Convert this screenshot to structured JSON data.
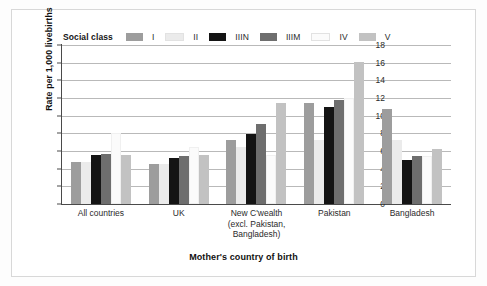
{
  "chart_data": {
    "type": "bar",
    "title": "",
    "xlabel": "Mother's country of birth",
    "ylabel": "Rate per 1,000 livebirths",
    "ylim": [
      0,
      18
    ],
    "yticks": [
      0,
      2,
      4,
      6,
      8,
      10,
      12,
      14,
      16,
      18
    ],
    "grid": true,
    "legend_title": "Social class",
    "legend_position": "top",
    "categories": [
      "All countries",
      "UK",
      "New C'wealth (excl. Pakistan, Bangladesh)",
      "Pakistan",
      "Bangladesh"
    ],
    "category_lines": [
      [
        "All countries",
        "",
        ""
      ],
      [
        "UK",
        "",
        ""
      ],
      [
        "New C'wealth",
        "(excl. Pakistan,",
        "Bangladesh)"
      ],
      [
        "Pakistan",
        "",
        ""
      ],
      [
        "Bangladesh",
        "",
        ""
      ]
    ],
    "series": [
      {
        "name": "I",
        "color": "#9d9d9d",
        "values": [
          4.7,
          4.5,
          7.3,
          11.4,
          10.8
        ]
      },
      {
        "name": "II",
        "color": "#ebebeb",
        "values": [
          4.7,
          4.5,
          6.5,
          7.2,
          7.2
        ]
      },
      {
        "name": "IIIN",
        "color": "#141414",
        "values": [
          5.5,
          5.2,
          7.9,
          11.0,
          4.95
        ]
      },
      {
        "name": "IIIM",
        "color": "#6e6e6e",
        "values": [
          5.7,
          5.45,
          9.1,
          11.8,
          5.45
        ]
      },
      {
        "name": "IV",
        "color": "#fbfbfb",
        "values": [
          8.0,
          6.4,
          5.5,
          12.0,
          5.4
        ]
      },
      {
        "name": "V",
        "color": "#c2c2c2",
        "values": [
          5.6,
          5.5,
          11.4,
          16.1,
          6.2
        ]
      }
    ]
  },
  "colors": {
    "axis": "#4a4a4a",
    "grid": "#b9b9b9",
    "text": "#2b2b2b",
    "frame": "#d8d8d8",
    "background": "#ffffff"
  }
}
